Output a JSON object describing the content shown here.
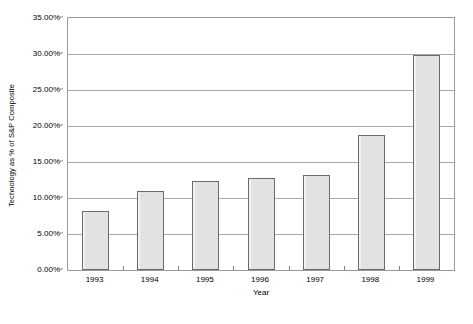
{
  "chart_data": {
    "type": "bar",
    "title": "",
    "xlabel": "Year",
    "ylabel": "Technology as % of S&P Composite",
    "categories": [
      "1993",
      "1994",
      "1995",
      "1996",
      "1997",
      "1998",
      "1999"
    ],
    "values": [
      8.2,
      11.0,
      12.3,
      12.8,
      13.2,
      18.8,
      29.9
    ],
    "value_labels": [
      "8.20%",
      "11.00%",
      "12.30%",
      "12.80%",
      "13.20%",
      "18.80%",
      "29.90%"
    ],
    "ylim": [
      0,
      35
    ],
    "ytick_values": [
      0,
      5,
      10,
      15,
      20,
      25,
      30,
      35
    ],
    "ytick_labels": [
      "0.00%",
      "5.00%",
      "10.00%",
      "15.00%",
      "20.00%",
      "25.00%",
      "30.00%",
      "35.00%"
    ],
    "grid": true,
    "grid_axis": "y",
    "legend": false,
    "legend_position": "none",
    "series": [
      {
        "name": "Technology as % of S&P Composite",
        "values": [
          8.2,
          11.0,
          12.3,
          12.8,
          13.2,
          18.8,
          29.9
        ]
      }
    ],
    "colors": {
      "bar_fill": "#e2e2e2",
      "bar_border": "#6b6b6b",
      "gridline": "#a8a8a8",
      "frame": "#9a9a9a",
      "text": "#000000",
      "background": "#ffffff"
    }
  },
  "caption": {
    "text": ""
  }
}
